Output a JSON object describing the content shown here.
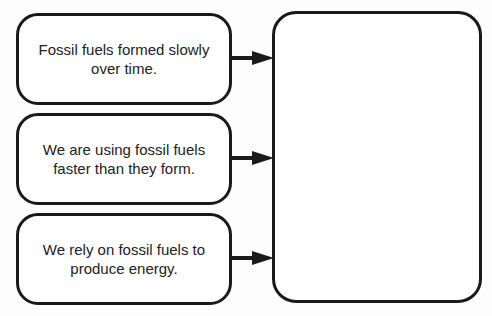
{
  "diagram": {
    "type": "cause-effect graphic organizer",
    "causes": [
      {
        "text": "Fossil fuels formed slowly over time."
      },
      {
        "text": "We are using fossil fuels faster than they form."
      },
      {
        "text": "We rely on fossil fuels to produce energy."
      }
    ],
    "effect": {
      "text": ""
    },
    "colors": {
      "stroke": "#1a1a1a",
      "fill": "#ffffff",
      "text": "#222222"
    }
  }
}
